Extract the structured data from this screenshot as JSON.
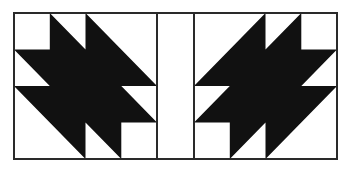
{
  "figure": {
    "colors": {
      "background": "#ffffff",
      "fill": "#111111",
      "stroke": "#2a2a2a"
    },
    "frame": {
      "x": 14,
      "y": 13,
      "width": 323,
      "height": 146
    },
    "grid": {
      "cells": 4
    },
    "blocks": [
      {
        "name": "left-block",
        "x": 14,
        "y": 13,
        "width": 143,
        "height": 146,
        "mirrored": false,
        "polygon_units": [
          [
            1,
            0
          ],
          [
            2,
            1
          ],
          [
            2,
            0
          ],
          [
            4,
            2
          ],
          [
            3,
            2
          ],
          [
            4,
            3
          ],
          [
            3,
            3
          ],
          [
            3,
            4
          ],
          [
            2,
            3
          ],
          [
            2,
            4
          ],
          [
            0,
            2
          ],
          [
            1,
            2
          ],
          [
            0,
            1
          ],
          [
            1,
            1
          ]
        ]
      },
      {
        "name": "right-block",
        "x": 194,
        "y": 13,
        "width": 143,
        "height": 146,
        "mirrored": true,
        "polygon_units": [
          [
            1,
            0
          ],
          [
            2,
            1
          ],
          [
            2,
            0
          ],
          [
            4,
            2
          ],
          [
            3,
            2
          ],
          [
            4,
            3
          ],
          [
            3,
            3
          ],
          [
            3,
            4
          ],
          [
            2,
            3
          ],
          [
            2,
            4
          ],
          [
            0,
            2
          ],
          [
            1,
            2
          ],
          [
            0,
            1
          ],
          [
            1,
            1
          ]
        ]
      }
    ],
    "sashing": {
      "x": 157,
      "y": 13,
      "width": 37,
      "height": 146
    }
  }
}
